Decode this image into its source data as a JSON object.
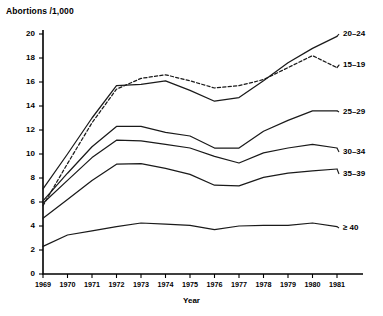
{
  "chart_data": {
    "type": "line",
    "title": "",
    "ylabel": "Abortions /1,000",
    "xlabel": "Year",
    "grid": false,
    "legend_position": "right-inline-labels",
    "x": [
      1969,
      1970,
      1971,
      1972,
      1973,
      1974,
      1975,
      1976,
      1977,
      1978,
      1979,
      1980,
      1981
    ],
    "xtick_labels": [
      "1969",
      "1970",
      "1971",
      "1972",
      "1973",
      "1974",
      "1975",
      "1976",
      "1977",
      "1978",
      "1979",
      "1980",
      "1981"
    ],
    "xlim": [
      1969,
      1981
    ],
    "ylim": [
      0,
      20
    ],
    "ytick_labels": [
      "0",
      "2",
      "4",
      "6",
      "8",
      "10",
      "12",
      "14",
      "16",
      "18",
      "20"
    ],
    "yticks": [
      0,
      2,
      4,
      6,
      8,
      10,
      12,
      14,
      16,
      18,
      20
    ],
    "series": [
      {
        "name": "20-24",
        "label": "20–24",
        "style": "solid",
        "values": [
          7.1,
          10.0,
          13.0,
          15.7,
          15.8,
          16.1,
          15.3,
          14.4,
          14.7,
          16.1,
          17.6,
          18.8,
          19.8
        ]
      },
      {
        "name": "15-19",
        "label": "15–19",
        "style": "dashed",
        "values": [
          5.7,
          9.2,
          12.6,
          15.4,
          16.3,
          16.6,
          16.1,
          15.5,
          15.7,
          16.2,
          17.2,
          18.2,
          17.2
        ]
      },
      {
        "name": "25-29",
        "label": "25–29",
        "style": "solid",
        "values": [
          6.1,
          8.4,
          10.6,
          12.3,
          12.3,
          11.8,
          11.5,
          10.5,
          10.5,
          11.9,
          12.8,
          13.6,
          13.6
        ]
      },
      {
        "name": "30-34",
        "label": "30–34",
        "style": "solid",
        "values": [
          5.9,
          7.8,
          9.7,
          11.15,
          11.1,
          10.8,
          10.5,
          9.8,
          9.25,
          10.1,
          10.5,
          10.8,
          10.5
        ]
      },
      {
        "name": "35-39",
        "label": "35–39",
        "style": "solid",
        "values": [
          4.65,
          6.2,
          7.8,
          9.15,
          9.2,
          8.8,
          8.3,
          7.4,
          7.35,
          8.05,
          8.4,
          8.6,
          8.75
        ]
      },
      {
        "name": "40plus",
        "label": "≥ 40",
        "style": "solid",
        "values": [
          2.3,
          3.25,
          3.6,
          3.95,
          4.25,
          4.15,
          4.05,
          3.7,
          4.0,
          4.05,
          4.05,
          4.25,
          3.95
        ]
      }
    ]
  },
  "labels": {
    "series_20_24": "20–24",
    "series_15_19": "15–19",
    "series_25_29": "25–29",
    "series_30_34": "30–34",
    "series_35_39": "35–39",
    "series_40_plus": "≥ 40"
  },
  "axis_title_y": "Abortions /1,000",
  "axis_title_x": "Year"
}
